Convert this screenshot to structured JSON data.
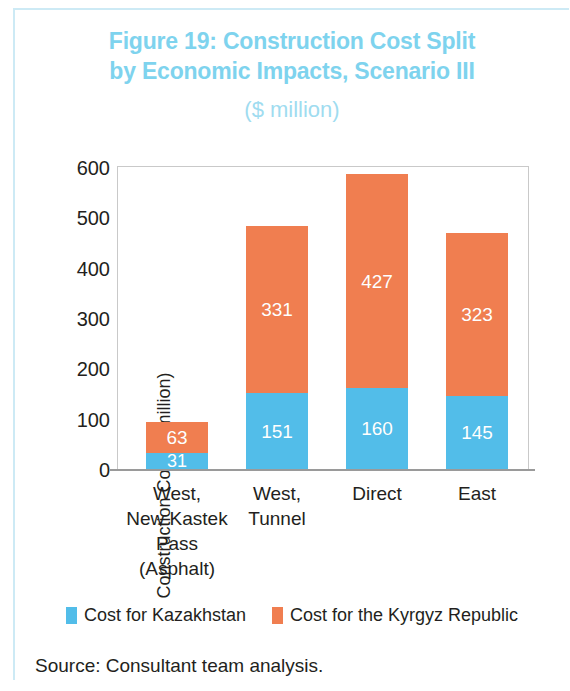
{
  "figure": {
    "title_line1": "Figure 19: Construction Cost Split",
    "title_line2": "by Economic Impacts, Scenario III",
    "subtitle": "($ million)",
    "source": "Source: Consultant team analysis.",
    "title_color": "#7ed3ee",
    "subtitle_color": "#9fdcf0",
    "frame_color": "#cdeaf5"
  },
  "chart_data": {
    "type": "bar",
    "stacked": true,
    "title": "Figure 19: Construction Cost Split by Economic Impacts, Scenario III ($ million)",
    "xlabel": "",
    "ylabel": "Construction Cost ($ million)",
    "ylim": [
      0,
      600
    ],
    "yticks": [
      0,
      100,
      200,
      300,
      400,
      500,
      600
    ],
    "ytick_labels": [
      "0",
      "100",
      "200",
      "300",
      "400",
      "500",
      "600"
    ],
    "grid": false,
    "legend_position": "bottom",
    "categories": [
      "West, New Kastek Pass (Asphalt)",
      "West, Tunnel",
      "Direct",
      "East"
    ],
    "category_lines": [
      [
        "West,",
        "New Kastek",
        "Pass",
        "(Asphalt)"
      ],
      [
        "West,",
        "Tunnel"
      ],
      [
        "Direct"
      ],
      [
        "East"
      ]
    ],
    "series": [
      {
        "name": "Cost for Kazakhstan",
        "color": "#52bde9",
        "values": [
          31,
          151,
          160,
          145
        ]
      },
      {
        "name": "Cost for the Kyrgyz Republic",
        "color": "#f07e50",
        "values": [
          63,
          331,
          427,
          323
        ]
      }
    ],
    "totals": [
      94,
      482,
      587,
      468
    ]
  },
  "legend": {
    "items": [
      {
        "label": "Cost for Kazakhstan",
        "color": "#52bde9"
      },
      {
        "label": "Cost for the Kyrgyz Republic",
        "color": "#f07e50"
      }
    ]
  }
}
